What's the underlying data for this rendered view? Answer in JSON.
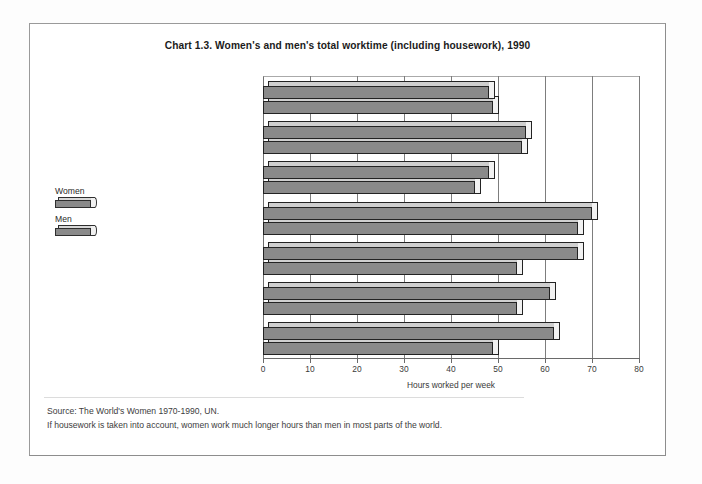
{
  "chart_data": {
    "type": "bar",
    "orientation": "horizontal",
    "title": "Chart 1.3.  Women's and men's total worktime (including housework), 1990",
    "xlabel": "Hours worked per week",
    "ylabel": "",
    "xlim": [
      0,
      80
    ],
    "xticks": [
      0,
      10,
      20,
      30,
      40,
      50,
      60,
      70,
      80
    ],
    "grid": true,
    "legend_position": "left",
    "categories": [
      "North America/Australia",
      "Japan",
      "Western Europe",
      "East Europe and ex-SU",
      "Africa",
      "Latin America & Caribb.",
      "Asia"
    ],
    "series": [
      {
        "name": "Women",
        "values": [
          48,
          56,
          48,
          70,
          67,
          61,
          62
        ]
      },
      {
        "name": "Men",
        "values": [
          49,
          55,
          45,
          67,
          54,
          54,
          49
        ]
      }
    ]
  },
  "legend": {
    "items": [
      {
        "label": "Women"
      },
      {
        "label": "Men"
      }
    ]
  },
  "footer": {
    "source": "Source: The World's Women 1970-1990, UN.",
    "note": "If housework is taken into account, women work much longer hours than men in most parts of the world."
  }
}
